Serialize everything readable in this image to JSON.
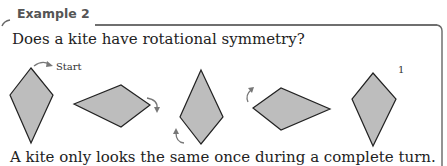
{
  "example": {
    "label": "Example 2",
    "question": "Does a kite have rotational symmetry?",
    "answer": "A kite only looks the same once during a complete turn."
  },
  "figure": {
    "start_label": "Start",
    "end_label": "1",
    "kite_fill": "#bdbdbd",
    "kite_stroke": "#222222",
    "arrow_color": "#777777",
    "kites": [
      {
        "orientation": "vertical",
        "points": "31,68 53,95 31,143 10,95"
      },
      {
        "orientation": "horizontal",
        "points": "74,104 121,85 150,105 121,127"
      },
      {
        "orientation": "vertical-inverted",
        "points": "201,70 223,117 201,144 180,117"
      },
      {
        "orientation": "horizontal-inverted",
        "points": "253,108 281,88 330,109 281,130"
      },
      {
        "orientation": "vertical",
        "points": "373,73 396,99 373,146 352,99"
      }
    ]
  }
}
